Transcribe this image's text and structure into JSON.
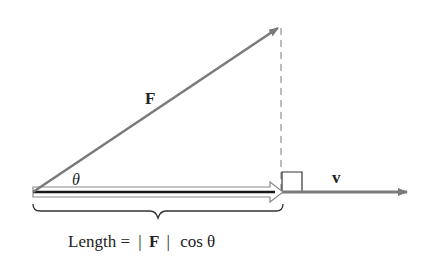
{
  "diagram": {
    "labels": {
      "force_vector": "F",
      "angle": "θ",
      "direction_vector": "v",
      "length_prefix": "Length = ",
      "length_abs_open": "|",
      "length_F": "F",
      "length_abs_close": "|",
      "length_suffix": "cos θ"
    },
    "colors": {
      "vector": "#7a7a7a",
      "projection_fill": "#ffffff",
      "projection_outline": "#8a8a8a",
      "projection_core": "#1a1a1a",
      "dashed": "#9a9a9a",
      "text": "#222222"
    },
    "geometry": {
      "origin": [
        33,
        192
      ],
      "F_tip": [
        279,
        27
      ],
      "v_tip": [
        408,
        192
      ],
      "projection_end": [
        282,
        192
      ],
      "right_angle_box": [
        282,
        172,
        20
      ]
    }
  }
}
